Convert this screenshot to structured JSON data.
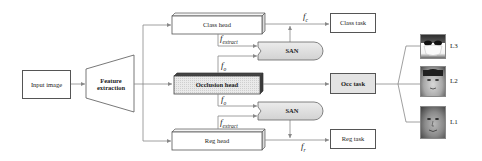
{
  "diagram": {
    "input": {
      "label": "Input image"
    },
    "extractor": {
      "label_line1": "Feature",
      "label_line2": "extraction"
    },
    "heads": {
      "class": {
        "label": "Class head"
      },
      "occlusion": {
        "label": "Occlusion head"
      },
      "reg": {
        "label": "Reg head"
      }
    },
    "san_upper": {
      "label": "SAN"
    },
    "san_lower": {
      "label": "SAN"
    },
    "tasks": {
      "class": {
        "label": "Class task"
      },
      "occ": {
        "label": "Occ task"
      },
      "reg": {
        "label": "Reg task"
      }
    },
    "features": {
      "f_extract_upper": {
        "base": "f",
        "sub": "extract"
      },
      "f_o_upper": {
        "base": "f",
        "sub": "o"
      },
      "f_o_lower": {
        "base": "f",
        "sub": "o"
      },
      "f_extract_lower": {
        "base": "f",
        "sub": "extract"
      },
      "f_c": {
        "base": "f",
        "sub": "c"
      },
      "f_r": {
        "base": "f",
        "sub": "r"
      }
    },
    "occlusion_levels": [
      {
        "label": "L3",
        "description": "face-with-mask-and-sunglasses"
      },
      {
        "label": "L2",
        "description": "face-partially-occluded"
      },
      {
        "label": "L1",
        "description": "face-unoccluded"
      }
    ]
  },
  "colors": {
    "line": "#7a7a7a",
    "box_border": "#555555",
    "grey_fill": "#e3e3e3",
    "dark_face": "#3a3a3a"
  }
}
